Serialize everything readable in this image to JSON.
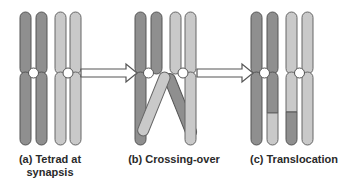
{
  "colors": {
    "dark_chromatid": "#8f8f8f",
    "light_chromatid": "#c9c9c9",
    "outline": "#555555",
    "centromere": "#ffffff"
  },
  "panels": [
    {
      "id": "a",
      "label_line1": "(a) Tetrad at",
      "label_line2": "synapsis"
    },
    {
      "id": "b",
      "label_line1": "(b) Crossing-over",
      "label_line2": ""
    },
    {
      "id": "c",
      "label_line1": "(c) Translocation",
      "label_line2": ""
    }
  ],
  "arrows": [
    {
      "from": "a",
      "to": "b"
    },
    {
      "from": "b",
      "to": "c"
    }
  ]
}
